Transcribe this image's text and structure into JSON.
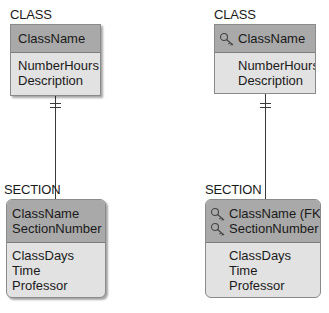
{
  "left_diagram": {
    "parent": {
      "entity_name": "CLASS",
      "key_attributes": [
        {
          "name": "ClassName",
          "key_icon": false
        }
      ],
      "attributes": [
        "NumberHours",
        "Description"
      ]
    },
    "child": {
      "entity_name": "SECTION",
      "key_attributes": [
        {
          "name": "ClassName",
          "key_icon": false
        },
        {
          "name": "SectionNumber",
          "key_icon": false
        }
      ],
      "attributes": [
        "ClassDays",
        "Time",
        "Professor"
      ]
    },
    "relationship": {
      "parent_cardinality": "exactly-one",
      "child_cardinality": "zero-or-many"
    }
  },
  "right_diagram": {
    "parent": {
      "entity_name": "CLASS",
      "key_attributes": [
        {
          "name": "ClassName",
          "key_icon": true
        }
      ],
      "attributes": [
        "NumberHours",
        "Description"
      ]
    },
    "child": {
      "entity_name": "SECTION",
      "key_attributes": [
        {
          "name": "ClassName (FK)",
          "key_icon": true
        },
        {
          "name": "SectionNumber",
          "key_icon": true
        }
      ],
      "attributes": [
        "ClassDays",
        "Time",
        "Professor"
      ]
    },
    "relationship": {
      "parent_cardinality": "exactly-one",
      "child_cardinality": "zero-or-many"
    }
  },
  "colors": {
    "header_fill": "#a9a9a9",
    "body_fill": "#e2e2e2",
    "border": "#8a8a8a",
    "line": "#333333"
  }
}
